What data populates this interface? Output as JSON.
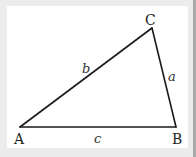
{
  "diagram": {
    "type": "triangle",
    "colors": {
      "background": "#ffffff",
      "frame": "#ececec",
      "edge_strip": "#a9a9a9",
      "stroke": "#1a1a1a",
      "text": "#222222"
    },
    "vertices": [
      {
        "id": "A",
        "label": "A",
        "x": 20,
        "y": 127,
        "label_x": 14,
        "label_y": 144
      },
      {
        "id": "B",
        "label": "B",
        "x": 176,
        "y": 127,
        "label_x": 172,
        "label_y": 144
      },
      {
        "id": "C",
        "label": "C",
        "x": 152,
        "y": 28,
        "label_x": 145,
        "label_y": 25
      }
    ],
    "sides": [
      {
        "id": "a",
        "label": "a",
        "from": "C",
        "to": "B",
        "label_x": 168,
        "label_y": 81
      },
      {
        "id": "b",
        "label": "b",
        "from": "A",
        "to": "C",
        "label_x": 82,
        "label_y": 73
      },
      {
        "id": "c",
        "label": "c",
        "from": "A",
        "to": "B",
        "label_x": 94,
        "label_y": 143
      }
    ]
  }
}
